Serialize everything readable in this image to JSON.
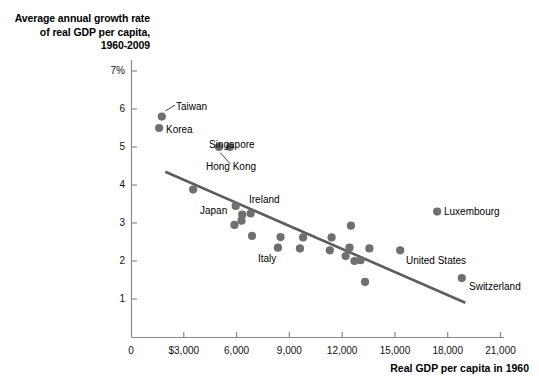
{
  "chart_data": {
    "type": "scatter",
    "title": "",
    "ylabel": "Average annual growth rate of real GDP per capita, 1960-2009",
    "xlabel": "Real GDP per capita in 1960",
    "xlim": [
      0,
      21000
    ],
    "ylim": [
      0,
      7
    ],
    "grid": false,
    "legend": "none",
    "x_ticks": [
      {
        "value": 0,
        "label": "0"
      },
      {
        "value": 3000,
        "label": "$3,000"
      },
      {
        "value": 6000,
        "label": "6,000"
      },
      {
        "value": 9000,
        "label": "9,000"
      },
      {
        "value": 12000,
        "label": "12,000"
      },
      {
        "value": 15000,
        "label": "15,000"
      },
      {
        "value": 18000,
        "label": "18,000"
      },
      {
        "value": 21000,
        "label": "21,000"
      }
    ],
    "y_ticks": [
      {
        "value": 1,
        "label": "1"
      },
      {
        "value": 2,
        "label": "2"
      },
      {
        "value": 3,
        "label": "3"
      },
      {
        "value": 4,
        "label": "4"
      },
      {
        "value": 5,
        "label": "5"
      },
      {
        "value": 6,
        "label": "6"
      },
      {
        "value": 7,
        "label": "7%"
      }
    ],
    "marker_color": "#6f6f6f",
    "line_color": "#5d5d5d",
    "axis_color": "#8a8a8a",
    "points": [
      {
        "x": 1750,
        "y": 5.8,
        "label": "Taiwan"
      },
      {
        "x": 1600,
        "y": 5.5,
        "label": "Korea"
      },
      {
        "x": 5000,
        "y": 5.0,
        "label": "Hong Kong"
      },
      {
        "x": 5620,
        "y": 5.0,
        "label": "Singapore"
      },
      {
        "x": 3530,
        "y": 3.88,
        "label": ""
      },
      {
        "x": 5950,
        "y": 3.45,
        "label": "Japan"
      },
      {
        "x": 6800,
        "y": 3.25,
        "label": "Ireland"
      },
      {
        "x": 6320,
        "y": 3.22,
        "label": ""
      },
      {
        "x": 6280,
        "y": 3.06,
        "label": ""
      },
      {
        "x": 5880,
        "y": 2.95,
        "label": ""
      },
      {
        "x": 6880,
        "y": 2.66,
        "label": ""
      },
      {
        "x": 8500,
        "y": 2.63,
        "label": ""
      },
      {
        "x": 8350,
        "y": 2.35,
        "label": "Italy"
      },
      {
        "x": 9600,
        "y": 2.33,
        "label": ""
      },
      {
        "x": 9780,
        "y": 2.62,
        "label": ""
      },
      {
        "x": 11400,
        "y": 2.62,
        "label": ""
      },
      {
        "x": 11300,
        "y": 2.28,
        "label": ""
      },
      {
        "x": 12500,
        "y": 2.93,
        "label": ""
      },
      {
        "x": 12420,
        "y": 2.35,
        "label": ""
      },
      {
        "x": 12200,
        "y": 2.13,
        "label": ""
      },
      {
        "x": 12700,
        "y": 2.0,
        "label": ""
      },
      {
        "x": 13050,
        "y": 2.02,
        "label": ""
      },
      {
        "x": 13550,
        "y": 2.33,
        "label": ""
      },
      {
        "x": 13300,
        "y": 1.45,
        "label": ""
      },
      {
        "x": 15300,
        "y": 2.28,
        "label": "United States"
      },
      {
        "x": 17400,
        "y": 3.3,
        "label": "Luxembourg"
      },
      {
        "x": 18800,
        "y": 1.55,
        "label": "Switzerland"
      }
    ],
    "trend_line": {
      "x1": 1950,
      "y1": 4.35,
      "x2": 19000,
      "y2": 0.9
    },
    "leader_lines": [
      {
        "name": "taiwan-leader",
        "x1": 1950,
        "y1": 5.95,
        "x2": 2500,
        "y2": 6.1
      },
      {
        "name": "hongkong-leader",
        "x1": 5080,
        "y1": 4.85,
        "x2": 5650,
        "y2": 4.55
      }
    ],
    "callout_labels": [
      {
        "name": "taiwan",
        "text": "Taiwan",
        "left": 176,
        "top": 101
      },
      {
        "name": "korea",
        "text": "Korea",
        "left": 166,
        "top": 124
      },
      {
        "name": "singapore",
        "text": "Singapore",
        "left": 209,
        "top": 139
      },
      {
        "name": "hong-kong",
        "text": "Hong Kong",
        "left": 206,
        "top": 161
      },
      {
        "name": "japan",
        "text": "Japan",
        "left": 200,
        "top": 205
      },
      {
        "name": "ireland",
        "text": "Ireland",
        "left": 249,
        "top": 194
      },
      {
        "name": "italy",
        "text": "Italy",
        "left": 258,
        "top": 253
      },
      {
        "name": "united-states",
        "text": "United States",
        "left": 406,
        "top": 255
      },
      {
        "name": "luxembourg",
        "text": "Luxembourg",
        "left": 444,
        "top": 206
      },
      {
        "name": "switzerland",
        "text": "Switzerland",
        "left": 469,
        "top": 281
      }
    ]
  }
}
